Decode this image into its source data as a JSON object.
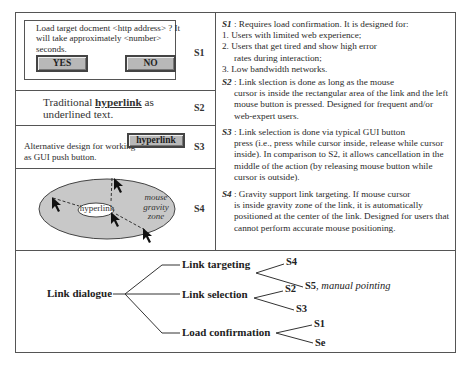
{
  "rows": [
    {
      "id": "S1",
      "tag": "S1",
      "dialog_text": "Load target docment <http address> ? It will take approximately <number> seconds.",
      "yes_label": "YES",
      "no_label": "NO"
    },
    {
      "id": "S2",
      "tag": "S2",
      "text_before": "Traditional ",
      "text_link": "hyperlink",
      "text_after": " as underlined text."
    },
    {
      "id": "S3",
      "tag": "S3",
      "text": "Alternative design for working as GUI push button.",
      "button_label": "hyperlink"
    },
    {
      "id": "S4",
      "tag": "S4",
      "inner_label": "hyperlink",
      "zone_label_1": "mouse",
      "zone_label_2": "gravity",
      "zone_label_3": "zone"
    }
  ],
  "descriptions": {
    "s1": {
      "head": "S1",
      "intro": " : Requires load confirmation. It is designed for:",
      "items": [
        "1. Users with limited web experience;",
        "2. Users that get tired and show high error",
        "rates during interaction;",
        "3. Low bandwidth networks."
      ]
    },
    "s2": {
      "head": "S2",
      "line1": " : Link slection is done as long as the mouse",
      "rest": "cursor is inside the rectangular area of the link and the left mouse button is pressed. Designed for frequent and/or web-expert users."
    },
    "s3": {
      "head": "S3",
      "line1": " : Link selection is done via typical GUI button",
      "rest": "press (i.e., press while cursor inside, release while cursor inside). In comparison to S2, it allows cancellation in the middle of the action (by releasing mouse button while cursor is outside)."
    },
    "s4": {
      "head": "S4",
      "line1": " : Gravity support link targeting. If mouse cursor",
      "rest": "is inside gravity zone of the link, it is automatically positioned at the center of the link. Designed for users that cannot perform accurate mouse positioning."
    }
  },
  "tree": {
    "root": "Link dialogue",
    "branches": [
      {
        "label": "Link targeting",
        "leaves": [
          "S4",
          "S5"
        ],
        "leaf2_note": ", manual pointing"
      },
      {
        "label": "Link selection",
        "leaves": [
          "S2",
          "S3"
        ]
      },
      {
        "label": "Load confirmation",
        "leaves": [
          "S1",
          "Se"
        ]
      }
    ]
  },
  "colors": {
    "frame": "#555555",
    "button_fill": "#b8b8b8",
    "zone_fill": "#c8c8c8"
  }
}
